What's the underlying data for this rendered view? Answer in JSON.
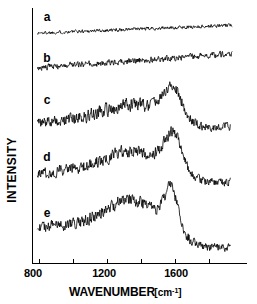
{
  "chart_data": {
    "type": "line",
    "title": "",
    "xlabel": "WAVENUMBER",
    "xunit": "[cm-1]",
    "ylabel": "INTENSITY",
    "xlim": [
      760,
      2000
    ],
    "ylim": [
      0,
      1
    ],
    "grid": false,
    "legend_position": "inline-left",
    "xticks_major": [
      800,
      1200,
      1600
    ],
    "xtick_labels": [
      "800",
      "1200",
      "1600"
    ],
    "xticks_minor": [
      1000,
      1400,
      1800
    ],
    "yaxis_ticks_shown": false,
    "series": [
      {
        "name": "a",
        "label": "a",
        "label_x": 1040,
        "baseline": 0.895,
        "slope": 0.03,
        "noise": 0.009,
        "peak_center": 1600,
        "peak_height": 0.0,
        "peak_width": 120,
        "broad_center": 1350,
        "broad_height": 0.0,
        "broad_width": 260,
        "tail_drop": 0.0
      },
      {
        "name": "b",
        "label": "b",
        "label_x": 1040,
        "baseline": 0.76,
        "slope": 0.055,
        "noise": 0.016,
        "peak_center": 1600,
        "peak_height": 0.0,
        "peak_width": 120,
        "broad_center": 1350,
        "broad_height": 0.0,
        "broad_width": 260,
        "tail_drop": 0.0
      },
      {
        "name": "c",
        "label": "c",
        "label_x": 1040,
        "baseline": 0.545,
        "slope": 0.07,
        "noise": 0.026,
        "peak_center": 1585,
        "peak_height": 0.115,
        "peak_width": 78,
        "broad_center": 1330,
        "broad_height": 0.04,
        "broad_width": 210,
        "tail_drop": 0.085
      },
      {
        "name": "d",
        "label": "d",
        "label_x": 1040,
        "baseline": 0.35,
        "slope": 0.075,
        "noise": 0.026,
        "peak_center": 1590,
        "peak_height": 0.135,
        "peak_width": 70,
        "broad_center": 1330,
        "broad_height": 0.055,
        "broad_width": 200,
        "tail_drop": 0.11
      },
      {
        "name": "e",
        "label": "e",
        "label_x": 1040,
        "baseline": 0.14,
        "slope": 0.07,
        "noise": 0.026,
        "peak_center": 1578,
        "peak_height": 0.15,
        "peak_width": 55,
        "broad_center": 1320,
        "broad_height": 0.075,
        "broad_width": 185,
        "tail_drop": 0.15
      }
    ],
    "colors": {
      "trace": "#000000",
      "axis": "#000000",
      "background": "#ffffff"
    }
  },
  "axis": {
    "x_title": "WAVENUMBER",
    "x_unit": "[cm",
    "x_unit_sup": "-1",
    "x_unit_close": "]",
    "y_title": "INTENSITY",
    "tick_800": "800",
    "tick_1200": "1200",
    "tick_1600": "1600"
  },
  "traces": {
    "a": "a",
    "b": "b",
    "c": "c",
    "d": "d",
    "e": "e"
  }
}
